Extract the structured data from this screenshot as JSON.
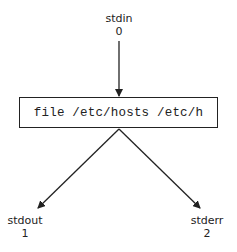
{
  "diagram": {
    "process": {
      "command": "file /etc/hosts /etc/h"
    },
    "streams": [
      {
        "name": "stdin",
        "fd": "0",
        "direction": "in"
      },
      {
        "name": "stdout",
        "fd": "1",
        "direction": "out"
      },
      {
        "name": "stderr",
        "fd": "2",
        "direction": "out"
      }
    ],
    "colors": {
      "stroke": "#222222",
      "background": "#ffffff"
    }
  }
}
